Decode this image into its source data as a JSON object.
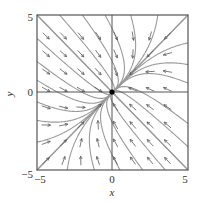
{
  "chart_data": {
    "type": "direction_field",
    "title": "",
    "xlabel": "x",
    "ylabel": "y",
    "xlim": [
      -5,
      5
    ],
    "ylim": [
      -5,
      5
    ],
    "xticks": [
      "-5",
      "0",
      "5"
    ],
    "yticks": [
      "-5",
      "0",
      "5"
    ],
    "system": {
      "a": -2,
      "b": 1,
      "c": 1,
      "d": -2,
      "description": "dx/dt = -2x + y, dy/dt = x - 2y (sink at origin)"
    },
    "equilibrium": {
      "x": 0,
      "y": 0
    },
    "grid_step": 1.15,
    "straight_line_solutions": [
      [
        1,
        1
      ],
      [
        1,
        -1
      ]
    ],
    "solution_starts": [
      [
        -5,
        5
      ],
      [
        -5,
        3.5
      ],
      [
        -5,
        2
      ],
      [
        -5,
        0.8
      ],
      [
        -3.5,
        5
      ],
      [
        -2,
        5
      ],
      [
        -0.5,
        5
      ],
      [
        1.2,
        5
      ],
      [
        3,
        5
      ],
      [
        5,
        5
      ],
      [
        5,
        3.2
      ],
      [
        5,
        1.8
      ],
      [
        5,
        0.6
      ],
      [
        5,
        -5
      ],
      [
        5,
        -3.5
      ],
      [
        5,
        -2
      ],
      [
        3.5,
        -5
      ],
      [
        2,
        -5
      ],
      [
        0.5,
        -5
      ],
      [
        -1.2,
        -5
      ],
      [
        -3,
        -5
      ],
      [
        -5,
        -5
      ],
      [
        -5,
        -3.2
      ],
      [
        -5,
        -1.8
      ],
      [
        -5,
        -0.6
      ]
    ]
  },
  "axes": {
    "x_label": "x",
    "y_label": "y",
    "tick_neg5": "−5",
    "tick_0": "0",
    "tick_5": "5"
  },
  "colors": {
    "frame": "#555555",
    "curve": "#9a9a9a",
    "arrow": "#5a5a5a",
    "dot": "#000000"
  }
}
